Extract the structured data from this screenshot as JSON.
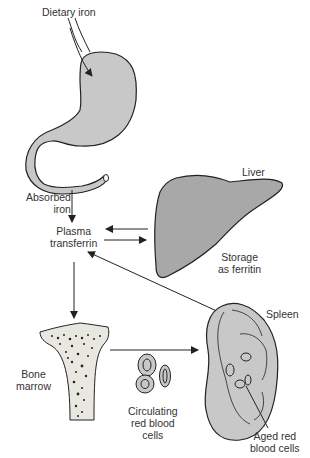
{
  "labels": {
    "dietary_iron": "Dietary iron",
    "absorbed_iron": [
      "Absorbed",
      "iron"
    ],
    "plasma_transferrin": [
      "Plasma",
      "transferrin"
    ],
    "liver": "Liver",
    "storage": [
      "Storage",
      "as ferritin"
    ],
    "spleen": "Spleen",
    "bone_marrow": [
      "Bone",
      "marrow"
    ],
    "circulating_rbc": [
      "Circulating",
      "red blood",
      "cells"
    ],
    "aged_rbc": [
      "Aged red",
      "blood cells"
    ]
  },
  "colors": {
    "organ_fill": "#c8c8c8",
    "liver_fill": "#a8a8a8",
    "stroke": "#222222",
    "text": "#333333"
  }
}
